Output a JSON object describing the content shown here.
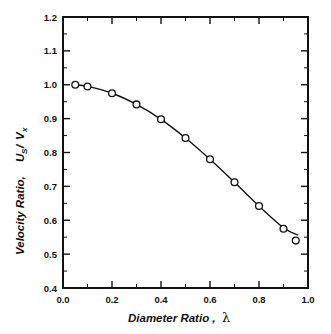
{
  "chart_data": {
    "type": "line",
    "title": "",
    "xlabel": "Diameter Ratio ,",
    "xlabel_symbol": "λ",
    "ylabel_prefix": "Velocity Ratio,",
    "ylabel_u": "U",
    "ylabel_u_sub": "S",
    "ylabel_slash": "/",
    "ylabel_v": "V",
    "ylabel_v_sub": "x",
    "xlim": [
      0.0,
      1.0
    ],
    "ylim": [
      0.4,
      1.2
    ],
    "xticks": [
      0.0,
      0.2,
      0.4,
      0.6,
      0.8,
      1.0
    ],
    "xtick_labels": [
      "0.0",
      "0.2",
      "0.4",
      "0.6",
      "0.8",
      "1.0"
    ],
    "xticks_minor": [
      0.1,
      0.3,
      0.5,
      0.7,
      0.9
    ],
    "yticks": [
      0.4,
      0.5,
      0.6,
      0.7,
      0.8,
      0.9,
      1.0,
      1.1,
      1.2
    ],
    "ytick_labels": [
      "0.4",
      "0.5",
      "0.6",
      "0.7",
      "0.8",
      "0.9",
      "1.0",
      "1.1",
      "1.2"
    ],
    "yticks_minor": [
      0.45,
      0.55,
      0.65,
      0.75,
      0.85,
      0.95,
      1.05,
      1.15
    ],
    "grid": false,
    "legend": null,
    "marker": "open-circle",
    "line_color": "#111111",
    "marker_face_color": "#ffffff",
    "x": [
      0.05,
      0.1,
      0.2,
      0.3,
      0.4,
      0.5,
      0.6,
      0.7,
      0.8,
      0.9,
      0.95
    ],
    "values": [
      1.0,
      0.995,
      0.975,
      0.942,
      0.898,
      0.843,
      0.78,
      0.712,
      0.642,
      0.575,
      0.54
    ],
    "curve_x": [
      0.05,
      0.1,
      0.2,
      0.3,
      0.4,
      0.5,
      0.6,
      0.7,
      0.8,
      0.9,
      0.96
    ],
    "curve_y": [
      1.0,
      0.995,
      0.975,
      0.942,
      0.898,
      0.843,
      0.78,
      0.712,
      0.642,
      0.578,
      0.556
    ]
  }
}
